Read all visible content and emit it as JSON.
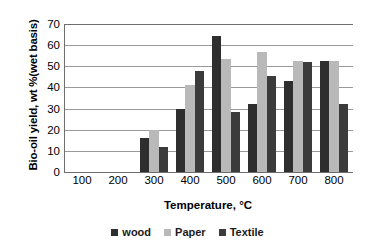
{
  "chart_data": {
    "type": "bar",
    "title": "",
    "xlabel": "Temperature, °C",
    "ylabel": "Bio-oil yield, wt %(wet basis)",
    "categories": [
      "100",
      "200",
      "300",
      "400",
      "500",
      "600",
      "700",
      "800"
    ],
    "series": [
      {
        "name": "wood",
        "color": "#2e2e2e",
        "values": [
          null,
          null,
          16.0,
          29.7,
          64.5,
          32.0,
          43.0,
          52.5
        ]
      },
      {
        "name": "Paper",
        "color": "#b9b9b9",
        "values": [
          null,
          null,
          19.8,
          41.0,
          53.4,
          56.9,
          52.5,
          52.4
        ]
      },
      {
        "name": "Textile",
        "color": "#3b3b3b",
        "values": [
          null,
          null,
          11.6,
          47.7,
          28.6,
          45.6,
          52.2,
          32.2
        ]
      }
    ],
    "ylim": [
      0,
      70
    ],
    "ytick_values": [
      0,
      10,
      20,
      30,
      40,
      50,
      60,
      70
    ],
    "ytick_labels": [
      "0",
      "10",
      "20",
      "30",
      "40",
      "50",
      "60",
      "70"
    ],
    "grid": true,
    "grid_axis": "y",
    "legend_position": "bottom",
    "axis_color": "#6f6f6f",
    "grid_color": "#9a9a9a",
    "background": "#ffffff"
  }
}
